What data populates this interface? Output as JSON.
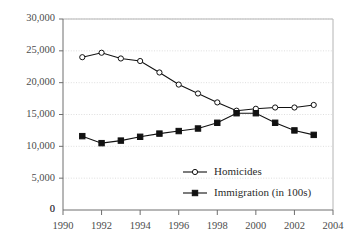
{
  "chart_data": {
    "type": "line",
    "title": "",
    "subtitle": "",
    "xlabel": "",
    "ylabel": "",
    "xlim": [
      1990,
      2004
    ],
    "ylim": [
      0,
      30000
    ],
    "grid": true,
    "grid_axis": "y",
    "legend_position": "inside-bottom-center",
    "x": [
      1991,
      1992,
      1993,
      1994,
      1995,
      1996,
      1997,
      1998,
      1999,
      2000,
      2001,
      2002,
      2003
    ],
    "xticks": [
      1990,
      1992,
      1994,
      1996,
      1998,
      2000,
      2002,
      2004
    ],
    "xtick_labels": [
      "1990",
      "1992",
      "1994",
      "1996",
      "1998",
      "2000",
      "2002",
      "2004"
    ],
    "yticks": [
      0,
      5000,
      10000,
      15000,
      20000,
      25000,
      30000
    ],
    "ytick_labels": [
      "0",
      "5,000",
      "10,000",
      "15,000",
      "20,000",
      "25,000",
      "30,000"
    ],
    "series": [
      {
        "name": "Homicides",
        "marker": "open-circle",
        "color": "#111111",
        "values": [
          24000,
          24700,
          23800,
          23400,
          21600,
          19700,
          18300,
          16900,
          15600,
          15900,
          16100,
          16100,
          16500
        ]
      },
      {
        "name": "Immigration (in 100s)",
        "marker": "filled-square",
        "color": "#111111",
        "values": [
          11600,
          10500,
          10900,
          11500,
          12000,
          12400,
          12800,
          13700,
          15200,
          15200,
          13700,
          12500,
          11800
        ]
      }
    ],
    "legend": [
      {
        "label": "Homicides",
        "marker": "open-circle"
      },
      {
        "label": "Immigration (in 100s)",
        "marker": "filled-square"
      }
    ],
    "colors": {
      "line": "#111111",
      "grid": "#d6d6d6",
      "axis": "#6e6e6e",
      "frame": "#b4b4b4",
      "tick_text": "#4c4c4c",
      "legend_text": "#2b2b2b",
      "background": "#ffffff"
    }
  }
}
